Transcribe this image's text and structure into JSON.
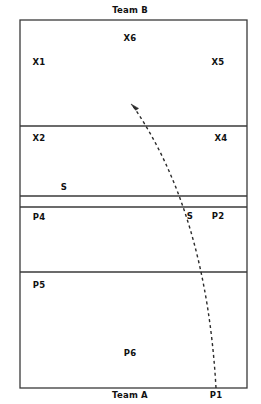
{
  "diagram": {
    "type": "volleyball-court-rotation",
    "title_top": "Team B",
    "title_bottom": "Team A",
    "stroke_color": "#3a3a3a",
    "text_color": "#111111",
    "background": "#ffffff"
  },
  "court": {
    "left": 20,
    "right": 247,
    "top": 20,
    "bottom": 388,
    "lines": [
      {
        "name": "attack-line-team-b",
        "y": 126
      },
      {
        "name": "net-line-upper",
        "y": 196
      },
      {
        "name": "net-line-lower",
        "y": 207
      },
      {
        "name": "attack-line-team-a",
        "y": 272
      }
    ]
  },
  "labels": {
    "team_b": {
      "text": "Team B",
      "x": 130,
      "y": 10
    },
    "team_a": {
      "text": "Team A",
      "x": 130,
      "y": 395
    },
    "p1_outside": {
      "text": "P1",
      "x": 216,
      "y": 395
    },
    "players": [
      {
        "text": "X6",
        "x": 130,
        "y": 38
      },
      {
        "text": "X1",
        "x": 39,
        "y": 62
      },
      {
        "text": "X5",
        "x": 218,
        "y": 62
      },
      {
        "text": "X2",
        "x": 39,
        "y": 138
      },
      {
        "text": "X4",
        "x": 221,
        "y": 138
      },
      {
        "text": "S",
        "x": 64,
        "y": 187
      },
      {
        "text": "P4",
        "x": 39,
        "y": 217
      },
      {
        "text": "S",
        "x": 190,
        "y": 216
      },
      {
        "text": "P2",
        "x": 218,
        "y": 216
      },
      {
        "text": "P5",
        "x": 39,
        "y": 285
      },
      {
        "text": "P6",
        "x": 130,
        "y": 353
      }
    ]
  },
  "arrow": {
    "name": "serve-trajectory",
    "style": "dashed-curve",
    "dash_pattern": "3 3",
    "stroke_width": 1.4,
    "start": {
      "x": 216,
      "y": 388
    },
    "control": {
      "x": 206,
      "y": 212
    },
    "end": {
      "x": 133,
      "y": 106
    },
    "arrowhead_at": "end",
    "arrowhead_direction": "up-left"
  }
}
